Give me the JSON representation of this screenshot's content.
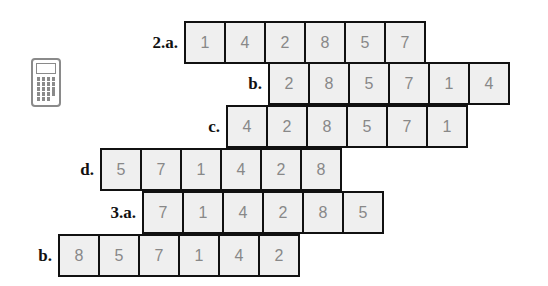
{
  "icon": "calculator-icon",
  "colors": {
    "cell_bg": "#efefef",
    "cell_border": "#111111",
    "digit": "#888888",
    "label": "#111111"
  },
  "rows": [
    {
      "label": "2.a.",
      "digits": [
        "1",
        "4",
        "2",
        "8",
        "5",
        "7"
      ]
    },
    {
      "label": "b.",
      "digits": [
        "2",
        "8",
        "5",
        "7",
        "1",
        "4"
      ]
    },
    {
      "label": "c.",
      "digits": [
        "4",
        "2",
        "8",
        "5",
        "7",
        "1"
      ]
    },
    {
      "label": "d.",
      "digits": [
        "5",
        "7",
        "1",
        "4",
        "2",
        "8"
      ]
    },
    {
      "label": "3.a.",
      "digits": [
        "7",
        "1",
        "4",
        "2",
        "8",
        "5"
      ]
    },
    {
      "label": "b.",
      "digits": [
        "8",
        "5",
        "7",
        "1",
        "4",
        "2"
      ]
    }
  ]
}
